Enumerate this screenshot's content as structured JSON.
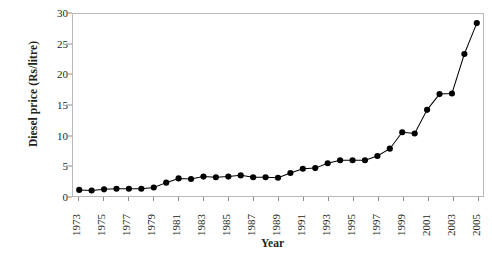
{
  "chart_data": {
    "type": "line",
    "title": "",
    "xlabel": "Year",
    "ylabel": "Diesel price (Rs/litre)",
    "xlim": [
      1972.5,
      2005.5
    ],
    "ylim": [
      0,
      30
    ],
    "yticks": [
      0,
      5,
      10,
      15,
      20,
      25,
      30
    ],
    "xticks": [
      1973,
      1975,
      1977,
      1979,
      1981,
      1983,
      1985,
      1987,
      1989,
      1991,
      1993,
      1995,
      1997,
      1999,
      2001,
      2003,
      2005
    ],
    "grid": false,
    "legend": false,
    "marker": "filled-circle",
    "marker_color": "#000000",
    "line_color": "#000000",
    "x": [
      1973,
      1974,
      1975,
      1976,
      1977,
      1978,
      1979,
      1980,
      1981,
      1982,
      1983,
      1984,
      1985,
      1986,
      1987,
      1988,
      1989,
      1990,
      1991,
      1992,
      1993,
      1994,
      1995,
      1996,
      1997,
      1998,
      1999,
      2000,
      2001,
      2002,
      2003,
      2004,
      2005
    ],
    "values": [
      1.0,
      0.9,
      1.1,
      1.2,
      1.2,
      1.2,
      1.4,
      2.2,
      2.9,
      2.8,
      3.2,
      3.1,
      3.2,
      3.4,
      3.1,
      3.1,
      3.0,
      3.8,
      4.5,
      4.6,
      5.4,
      5.9,
      5.9,
      5.9,
      6.6,
      7.8,
      10.5,
      10.3,
      14.2,
      16.8,
      16.9,
      23.4,
      28.5
    ]
  }
}
